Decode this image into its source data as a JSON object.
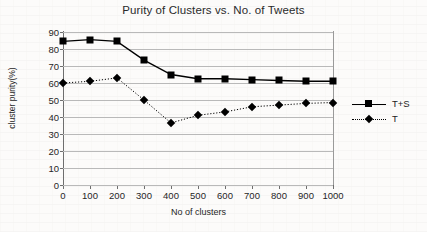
{
  "chart_data": {
    "type": "line",
    "title": "Purity of Clusters vs. No. of Tweets",
    "xlabel": "No of clusters",
    "ylabel": "cluster purity(%)",
    "x": [
      0,
      100,
      200,
      300,
      400,
      500,
      600,
      700,
      800,
      900,
      1000
    ],
    "xlim": [
      0,
      1000
    ],
    "ylim": [
      0,
      90
    ],
    "xticks": [
      "0",
      "100",
      "200",
      "300",
      "400",
      "500",
      "600",
      "700",
      "800",
      "900",
      "1000"
    ],
    "yticks": [
      "0",
      "10",
      "20",
      "30",
      "40",
      "50",
      "60",
      "70",
      "80",
      "90"
    ],
    "grid": "horizontal",
    "legend_position": "right",
    "series": [
      {
        "name": "T+S",
        "linestyle": "solid",
        "marker": "square",
        "color": "#000000",
        "values": [
          84.5,
          85.5,
          84.5,
          73.5,
          65,
          62.5,
          62.5,
          62,
          61.5,
          61,
          61
        ]
      },
      {
        "name": "T",
        "linestyle": "dotted",
        "marker": "diamond",
        "color": "#000000",
        "values": [
          60,
          61,
          63,
          50,
          36.5,
          41,
          43,
          46,
          47,
          48,
          48.5
        ]
      }
    ]
  }
}
